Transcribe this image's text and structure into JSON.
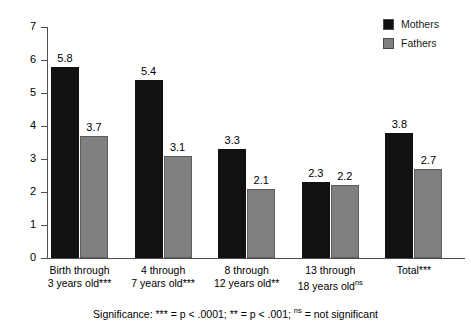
{
  "chart_data": {
    "type": "bar",
    "title": "",
    "xlabel": "",
    "ylabel": "",
    "ylim": [
      0,
      7
    ],
    "yticks": [
      "0",
      "1",
      "2",
      "3",
      "4",
      "5",
      "6",
      "7"
    ],
    "grid": false,
    "legend_position": "top-right",
    "categories": [
      "Birth through 3 years old***",
      "4 through 7 years old***",
      "8 through 12 years old**",
      "13 through 18 years old",
      "Total***"
    ],
    "category_lines": [
      {
        "line1": "Birth through",
        "line2": "3 years old***",
        "sup": ""
      },
      {
        "line1": "4 through",
        "line2": "7 years old***",
        "sup": ""
      },
      {
        "line1": "8 through",
        "line2": "12 years old**",
        "sup": ""
      },
      {
        "line1": "13 through",
        "line2": "18 years old",
        "sup": "ns"
      },
      {
        "line1": "Total***",
        "line2": "",
        "sup": ""
      }
    ],
    "series": [
      {
        "name": "Mothers",
        "color": "#111111",
        "values": [
          5.8,
          5.4,
          3.3,
          2.3,
          3.8
        ]
      },
      {
        "name": "Fathers",
        "color": "#808080",
        "values": [
          3.7,
          3.1,
          2.1,
          2.2,
          2.7
        ]
      }
    ],
    "value_labels": {
      "mothers": [
        "5.8",
        "5.4",
        "3.3",
        "2.3",
        "3.8"
      ],
      "fathers": [
        "3.7",
        "3.1",
        "2.1",
        "2.2",
        "2.7"
      ]
    },
    "annotations": {
      "footnote_prefix": "Significance: *** = p < .0001; ** = p < .001; ",
      "footnote_sup": "ns",
      "footnote_suffix": " = not significant"
    }
  },
  "legend": {
    "items": [
      {
        "label": "Mothers",
        "color": "#111111"
      },
      {
        "label": "Fathers",
        "color": "#808080"
      }
    ]
  }
}
